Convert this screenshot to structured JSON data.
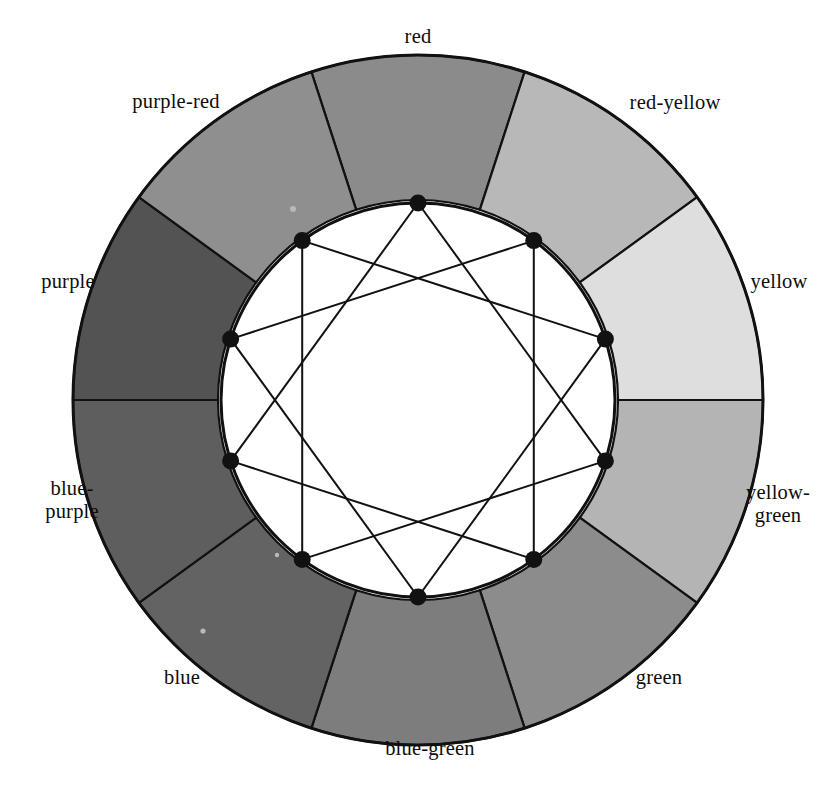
{
  "figure": {
    "kind": "color-wheel-diagram",
    "title": "",
    "background_color": "#ffffff",
    "line_color": "#111111",
    "label_color": "#0d0d0d"
  },
  "geometry": {
    "center_x": 418,
    "center_y": 400,
    "outer_radius": 345,
    "inner_ring_radius": 200,
    "inner_disc_radius": 197,
    "vertex_radius": 197,
    "segment_count": 10,
    "segment_span_degrees": 36,
    "start_angle_degrees": -108,
    "star_step": 3,
    "vertex_dot_radius": 8.5
  },
  "chart_data": {
    "type": "pie",
    "title": "",
    "subtitle": "",
    "xlabel": "",
    "ylabel": "",
    "legend_position": "around-ring",
    "grid": false,
    "categories": [
      "red",
      "red-yellow",
      "yellow",
      "yellow-green",
      "green",
      "blue-green",
      "blue",
      "blue-purple",
      "purple",
      "purple-red"
    ],
    "values": [
      36,
      36,
      36,
      36,
      36,
      36,
      36,
      36,
      36,
      36
    ],
    "colors": [
      "#8b8b8b",
      "#b8b8b8",
      "#dedede",
      "#b4b4b4",
      "#8c8c8c",
      "#7d7d7d",
      "#636363",
      "#5e5e5e",
      "#535353",
      "#8f8f8f"
    ],
    "annotations": [
      "inner white disc with 10 vertices",
      "{10/3} star polygon chords connecting every third vertex"
    ]
  },
  "segments": [
    {
      "id": "segment-red",
      "label": "red",
      "label_lines": [
        "red"
      ],
      "fill": "#8b8b8b",
      "center_angle_degrees": -90,
      "label_x": 418,
      "label_y": 36,
      "label_align": "center"
    },
    {
      "id": "segment-red-yellow",
      "label": "red-yellow",
      "label_lines": [
        "red-yellow"
      ],
      "fill": "#b8b8b8",
      "center_angle_degrees": -54,
      "label_x": 675,
      "label_y": 102,
      "label_align": "center"
    },
    {
      "id": "segment-yellow",
      "label": "yellow",
      "label_lines": [
        "yellow"
      ],
      "fill": "#dedede",
      "center_angle_degrees": -18,
      "label_x": 779,
      "label_y": 281,
      "label_align": "center"
    },
    {
      "id": "segment-yellow-green",
      "label": "yellow-green",
      "label_lines": [
        "yellow-",
        "green"
      ],
      "fill": "#b4b4b4",
      "center_angle_degrees": 18,
      "label_x": 778,
      "label_y": 504,
      "label_align": "center"
    },
    {
      "id": "segment-green",
      "label": "green",
      "label_lines": [
        "green"
      ],
      "fill": "#8c8c8c",
      "center_angle_degrees": 54,
      "label_x": 659,
      "label_y": 677,
      "label_align": "center"
    },
    {
      "id": "segment-blue-green",
      "label": "blue-green",
      "label_lines": [
        "blue-green"
      ],
      "fill": "#7d7d7d",
      "center_angle_degrees": 90,
      "label_x": 430,
      "label_y": 748,
      "label_align": "center"
    },
    {
      "id": "segment-blue",
      "label": "blue",
      "label_lines": [
        "blue"
      ],
      "fill": "#636363",
      "center_angle_degrees": 126,
      "label_x": 182,
      "label_y": 677,
      "label_align": "center"
    },
    {
      "id": "segment-blue-purple",
      "label": "blue-purple",
      "label_lines": [
        "blue-",
        "purple"
      ],
      "fill": "#5e5e5e",
      "center_angle_degrees": 162,
      "label_x": 72,
      "label_y": 500,
      "label_align": "center"
    },
    {
      "id": "segment-purple",
      "label": "purple",
      "label_lines": [
        "purple"
      ],
      "fill": "#535353",
      "center_angle_degrees": 198,
      "label_x": 68,
      "label_y": 281,
      "label_align": "center"
    },
    {
      "id": "segment-purple-red",
      "label": "purple-red",
      "label_lines": [
        "purple-red"
      ],
      "fill": "#8f8f8f",
      "center_angle_degrees": 234,
      "label_x": 176,
      "label_y": 101,
      "label_align": "center"
    }
  ]
}
